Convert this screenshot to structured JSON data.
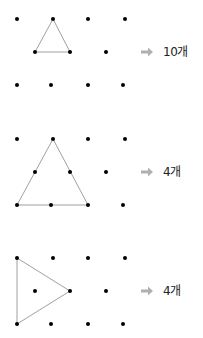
{
  "colors": {
    "dot": "#000000",
    "line": "#a0a0a0",
    "arrow": "#b0b0b0",
    "text": "#222222"
  },
  "grid": {
    "rows": [
      {
        "dy": 0,
        "xs": [
          17,
          53,
          88,
          125
        ]
      },
      {
        "dy": 33,
        "xs": [
          35,
          70,
          106
        ]
      },
      {
        "dy": 66,
        "xs": [
          17,
          51,
          88,
          123
        ]
      }
    ],
    "dot_radius": 2
  },
  "problems": [
    {
      "top": 19,
      "triangle": [
        [
          53,
          19
        ],
        [
          35,
          52
        ],
        [
          70,
          52
        ]
      ],
      "answer": "10개",
      "arrow_y": 52
    },
    {
      "top": 139,
      "triangle": [
        [
          53,
          139
        ],
        [
          17,
          205
        ],
        [
          88,
          205
        ]
      ],
      "answer": "4개",
      "arrow_y": 172
    },
    {
      "top": 258,
      "triangle": [
        [
          17,
          258
        ],
        [
          70,
          291
        ],
        [
          17,
          324
        ]
      ],
      "answer": "4개",
      "arrow_y": 291
    }
  ]
}
